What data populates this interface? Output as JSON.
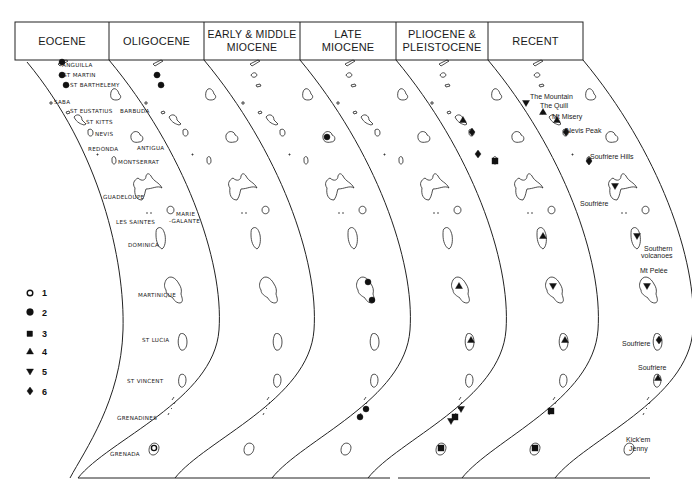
{
  "figure": {
    "periods": [
      {
        "id": "eocene",
        "label": "EOCENE"
      },
      {
        "id": "oligocene",
        "label": "OLIGOCENE"
      },
      {
        "id": "early-middle-miocene",
        "label": "EARLY & MIDDLE\nMIOCENE"
      },
      {
        "id": "late-miocene",
        "label": "LATE\nMIOCENE"
      },
      {
        "id": "pliocene-pleistocene",
        "label": "PLIOCENE &\nPLEISTOCENE"
      },
      {
        "id": "recent",
        "label": "RECENT"
      }
    ],
    "island_labels": [
      {
        "id": "anguilla",
        "text": "ANGUILLA"
      },
      {
        "id": "st-martin",
        "text": "ST MARTIN"
      },
      {
        "id": "st-barthelemy",
        "text": "ST BARTHELEMY"
      },
      {
        "id": "saba",
        "text": "SABA"
      },
      {
        "id": "st-eustatius",
        "text": "ST EUSTATIUS"
      },
      {
        "id": "st-kitts",
        "text": "ST KITTS"
      },
      {
        "id": "nevis",
        "text": "NEVIS"
      },
      {
        "id": "redonda",
        "text": "REDONDA"
      },
      {
        "id": "montserrat",
        "text": "MONTSERRAT"
      },
      {
        "id": "barbuda",
        "text": "BARBUDA"
      },
      {
        "id": "antigua",
        "text": "ANTIGUA"
      },
      {
        "id": "guadeloupe",
        "text": "GUADELOUPE"
      },
      {
        "id": "les-saintes",
        "text": "LES SAINTES"
      },
      {
        "id": "marie-galante-1",
        "text": "MARIE"
      },
      {
        "id": "marie-galante-2",
        "text": "-GALANTE"
      },
      {
        "id": "dominica",
        "text": "DOMINICA"
      },
      {
        "id": "martinique",
        "text": "MARTINIQUE"
      },
      {
        "id": "st-lucia",
        "text": "ST LUCIA"
      },
      {
        "id": "st-vincent",
        "text": "ST VINCENT"
      },
      {
        "id": "grenadines",
        "text": "GRENADINES"
      },
      {
        "id": "grenada",
        "text": "GRENADA"
      }
    ],
    "volcano_labels": [
      {
        "id": "the-mountain",
        "text": "The Mountain"
      },
      {
        "id": "the-quill",
        "text": "The Quill"
      },
      {
        "id": "mt-misery",
        "text": "Mt Misery"
      },
      {
        "id": "nevis-peak",
        "text": "Nevis Peak"
      },
      {
        "id": "soufriere-hills",
        "text": "Soufriere Hills"
      },
      {
        "id": "soufriere-guadeloupe",
        "text": "Soufrière"
      },
      {
        "id": "southern-volcanoes-1",
        "text": "Southern"
      },
      {
        "id": "southern-volcanoes-2",
        "text": "volcanoes"
      },
      {
        "id": "mt-pelee",
        "text": "Mt Pelée"
      },
      {
        "id": "soufriere-st-lucia",
        "text": "Soufriere"
      },
      {
        "id": "soufriere-st-vincent",
        "text": "Soufriere"
      },
      {
        "id": "kick-em-jenny-1",
        "text": "Kick'em"
      },
      {
        "id": "kick-em-jenny-2",
        "text": "Jenny"
      }
    ],
    "legend": [
      {
        "symbol": "open-circle",
        "label": "1"
      },
      {
        "symbol": "filled-circle",
        "label": "2"
      },
      {
        "symbol": "filled-square",
        "label": "3"
      },
      {
        "symbol": "triangle-up",
        "label": "4"
      },
      {
        "symbol": "triangle-down",
        "label": "5"
      },
      {
        "symbol": "diamond",
        "label": "6"
      }
    ],
    "occurrences": [
      {
        "period": 0,
        "island": "anguilla",
        "symbol": 2
      },
      {
        "period": 0,
        "island": "st-martin",
        "symbol": 2
      },
      {
        "period": 0,
        "island": "st-barthelemy",
        "symbol": 2
      },
      {
        "period": 0,
        "island": "grenada",
        "symbol": 1
      },
      {
        "period": 1,
        "island": "st-martin",
        "symbol": 2
      },
      {
        "period": 1,
        "island": "st-barthelemy",
        "symbol": 2
      },
      {
        "period": 2,
        "island": "antigua",
        "symbol": 2
      },
      {
        "period": 2,
        "island": "martinique-n",
        "symbol": 2
      },
      {
        "period": 2,
        "island": "martinique-s",
        "symbol": 2
      },
      {
        "period": 2,
        "island": "grenadines-n",
        "symbol": 2
      },
      {
        "period": 2,
        "island": "grenadines-s",
        "symbol": 2
      },
      {
        "period": 3,
        "island": "martinique",
        "symbol": 4
      },
      {
        "period": 3,
        "island": "st-lucia",
        "symbol": 4
      },
      {
        "period": 3,
        "island": "grenadines-n",
        "symbol": 5
      },
      {
        "period": 3,
        "island": "grenadines-s",
        "symbol": 3
      },
      {
        "period": 3,
        "island": "grenadines-s2",
        "symbol": 5
      },
      {
        "period": 3,
        "island": "grenada",
        "symbol": 3
      },
      {
        "period": 4,
        "island": "st-kitts",
        "symbol": 4
      },
      {
        "period": 4,
        "island": "nevis",
        "symbol": 6
      },
      {
        "period": 4,
        "island": "montserrat",
        "symbol": 3
      },
      {
        "period": 4,
        "island": "redonda",
        "symbol": 6
      },
      {
        "period": 4,
        "island": "dominica",
        "symbol": 4
      },
      {
        "period": 4,
        "island": "martinique",
        "symbol": 5
      },
      {
        "period": 4,
        "island": "st-lucia",
        "symbol": 4
      },
      {
        "period": 4,
        "island": "grenadines",
        "symbol": 3
      },
      {
        "period": 4,
        "island": "grenada",
        "symbol": 3
      },
      {
        "period": 5,
        "island": "saba",
        "symbol": 5
      },
      {
        "period": 5,
        "island": "st-eustatius",
        "symbol": 4
      },
      {
        "period": 5,
        "island": "st-kitts",
        "symbol": 4
      },
      {
        "period": 5,
        "island": "nevis",
        "symbol": 6
      },
      {
        "period": 5,
        "island": "montserrat",
        "symbol": 6
      },
      {
        "period": 5,
        "island": "guadeloupe",
        "symbol": 5
      },
      {
        "period": 5,
        "island": "dominica",
        "symbol": 5
      },
      {
        "period": 5,
        "island": "martinique",
        "symbol": 5
      },
      {
        "period": 5,
        "island": "st-lucia",
        "symbol": 6
      },
      {
        "period": 5,
        "island": "st-vincent",
        "symbol": 4
      },
      {
        "period": 5,
        "island": "kick-em-jenny",
        "symbol": 3
      }
    ]
  }
}
